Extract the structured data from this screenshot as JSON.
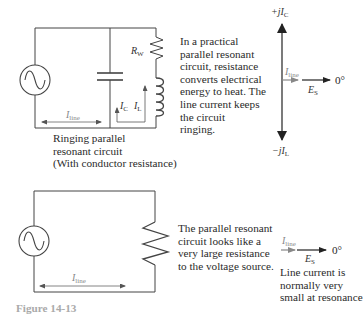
{
  "top_circuit": {
    "resistor_label": "R",
    "resistor_sub": "W",
    "ic_label": "I",
    "ic_sub": "C",
    "il_label": "I",
    "il_sub": "L",
    "line_label": "I",
    "line_sub": "line",
    "caption": [
      "Ringing parallel",
      "resonant circuit",
      "(With conductor resistance)"
    ]
  },
  "top_description": [
    "In a practical",
    "parallel resonant",
    "circuit, resistance",
    "converts electrical",
    "energy to heat. The",
    "line current keeps",
    "the circuit",
    "ringing."
  ],
  "top_phasor": {
    "up_label": "+jI",
    "up_sub": "C",
    "down_label": "−jI",
    "down_sub": "L",
    "iline_label": "I",
    "iline_sub": "line",
    "es_label": "E",
    "es_sub": "S",
    "angle": "0°"
  },
  "bottom_circuit": {
    "line_label": "I",
    "line_sub": "line"
  },
  "bottom_description": [
    "The parallel resonant",
    "circuit looks like a",
    "very large resistance",
    "to the voltage source."
  ],
  "bottom_phasor": {
    "iline_label": "I",
    "iline_sub": "line",
    "es_label": "E",
    "es_sub": "S",
    "angle": "0°",
    "note": [
      "Line current is",
      "normally very",
      "small at resonance"
    ]
  },
  "figure_caption": "Figure 14-13"
}
